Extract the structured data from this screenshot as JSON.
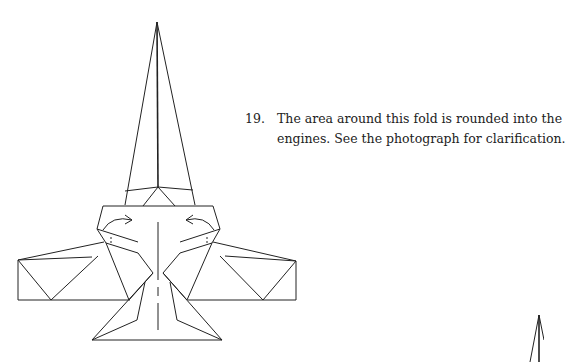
{
  "instruction": {
    "step_number": "19.",
    "lines": [
      "The area around this fold is rounded into the",
      "engines. See the photograph for clarification."
    ]
  },
  "diagram": {
    "elements": [
      "nose-cone",
      "fuselage",
      "left-wing",
      "right-wing",
      "tail-fins",
      "fold-arrows",
      "center-valley-line"
    ],
    "colors": {
      "line": "#222222",
      "background": "#ffffff"
    }
  }
}
